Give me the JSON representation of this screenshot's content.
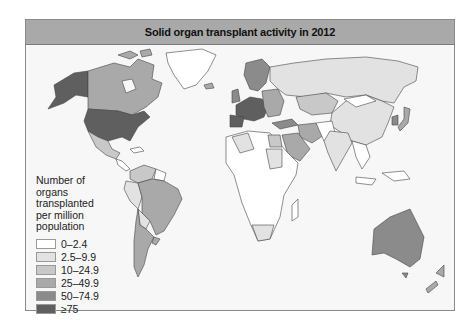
{
  "title": "Solid organ transplant activity in 2012",
  "legend": {
    "title_lines": [
      "Number of",
      "organs",
      "transplanted",
      "per million",
      "population"
    ],
    "items": [
      {
        "label": "0–2.4",
        "color": "#ffffff"
      },
      {
        "label": "2.5–9.9",
        "color": "#e2e2e2"
      },
      {
        "label": "10–24.9",
        "color": "#c8c8c8"
      },
      {
        "label": "25–49.9",
        "color": "#a9a9a9"
      },
      {
        "label": "50–74.9",
        "color": "#8b8b8b"
      },
      {
        "label": "≥75",
        "color": "#5f5f5f"
      }
    ]
  },
  "regions": {
    "usa": "≥75",
    "canada": "25–49.9",
    "alaska": "≥75",
    "greenland": "0–2.4",
    "mexico": "10–24.9",
    "brazil": "25–49.9",
    "argentina": "25–49.9",
    "colombia_venezuela": "10–24.9",
    "peru_bolivia": "2.5–9.9",
    "western_europe": "≥75",
    "scandinavia": "50–74.9",
    "eastern_europe": "25–49.9",
    "russia": "2.5–9.9",
    "china": "2.5–9.9",
    "kazakhstan": "10–24.9",
    "india": "2.5–9.9",
    "iran": "25–49.9",
    "saudi_arabia": "25–49.9",
    "turkey": "50–74.9",
    "egypt": "10–24.9",
    "south_africa": "2.5–9.9",
    "algeria": "2.5–9.9",
    "africa_other": "0–2.4",
    "japan": "25–49.9",
    "south_korea": "50–74.9",
    "australia": "50–74.9",
    "new_zealand": "25–49.9",
    "southeast_asia": "0–2.4"
  }
}
